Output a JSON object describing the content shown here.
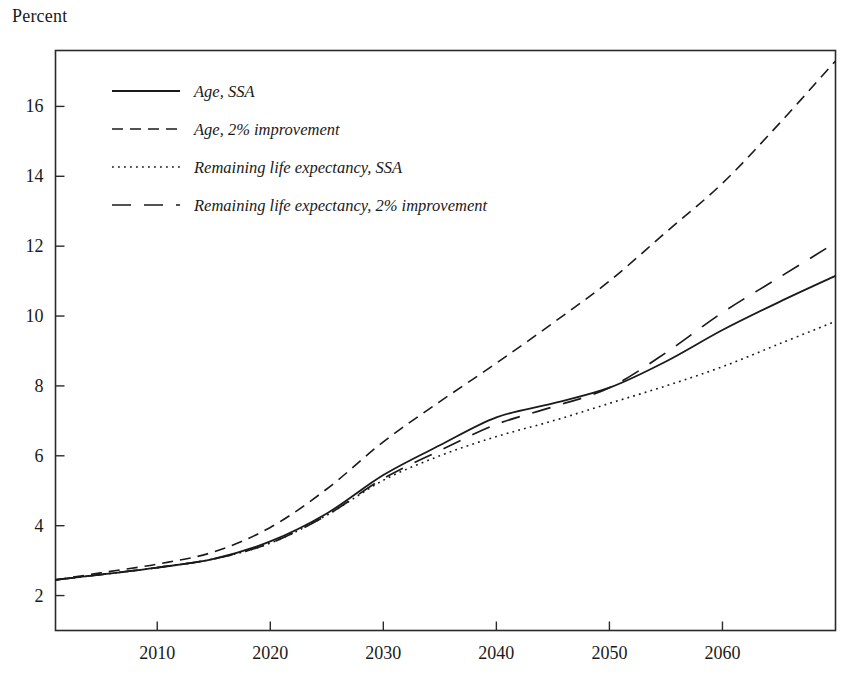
{
  "figure": {
    "unit_label": "Percent",
    "background": "#ffffff",
    "ink_color": "#1a1a1a"
  },
  "chart_data": {
    "type": "line",
    "title": "",
    "subtitle": "",
    "xlabel": "",
    "ylabel": "Percent",
    "grid": false,
    "legend_position": "top-left",
    "xlim": [
      2001,
      2070
    ],
    "ylim": [
      1.0,
      17.6
    ],
    "xticks": [
      2010,
      2020,
      2030,
      2040,
      2050,
      2060
    ],
    "xtick_labels": [
      "2010",
      "2020",
      "2030",
      "2040",
      "2050",
      "2060"
    ],
    "yticks": [
      2,
      4,
      6,
      8,
      10,
      12,
      14,
      16
    ],
    "ytick_labels": [
      "2",
      "4",
      "6",
      "8",
      "10",
      "12",
      "14",
      "16"
    ],
    "x": [
      2001,
      2005,
      2010,
      2015,
      2020,
      2025,
      2030,
      2035,
      2040,
      2045,
      2050,
      2055,
      2060,
      2065,
      2070
    ],
    "series": [
      {
        "name": "Age, SSA",
        "dash": "none",
        "stroke_width": 1.8,
        "values": [
          2.45,
          2.6,
          2.8,
          3.05,
          3.55,
          4.35,
          5.45,
          6.3,
          7.1,
          7.5,
          7.95,
          8.7,
          9.6,
          10.4,
          11.15
        ]
      },
      {
        "name": "Age, 2% improvement",
        "dash": "dashed",
        "stroke_width": 1.6,
        "values": [
          2.45,
          2.65,
          2.9,
          3.25,
          3.95,
          5.05,
          6.4,
          7.55,
          8.65,
          9.8,
          11.0,
          12.4,
          13.8,
          15.5,
          17.3
        ]
      },
      {
        "name": "Remaining life expectancy, SSA",
        "dash": "dotted",
        "stroke_width": 1.6,
        "values": [
          2.45,
          2.6,
          2.8,
          3.05,
          3.5,
          4.3,
          5.3,
          6.0,
          6.55,
          7.0,
          7.5,
          8.0,
          8.55,
          9.2,
          9.85
        ]
      },
      {
        "name": "Remaining life expectancy, 2% improvement",
        "dash": "long-dash",
        "stroke_width": 1.7,
        "values": [
          2.45,
          2.6,
          2.8,
          3.05,
          3.5,
          4.3,
          5.35,
          6.15,
          6.9,
          7.4,
          7.95,
          8.95,
          10.1,
          11.1,
          12.1
        ]
      }
    ]
  },
  "legend": {
    "entries": [
      {
        "label": "Age, SSA",
        "style": "solid"
      },
      {
        "label": "Age, 2% improvement",
        "style": "dashed"
      },
      {
        "label": "Remaining life expectancy, SSA",
        "style": "dotted"
      },
      {
        "label": "Remaining life expectancy, 2% improvement",
        "style": "long-dash"
      }
    ]
  }
}
